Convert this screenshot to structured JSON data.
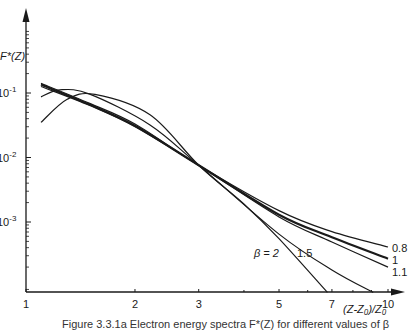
{
  "chart_data": {
    "type": "line",
    "title": "",
    "xlabel": "(Z-Z₀)/Z₀",
    "ylabel": "F*(Z)",
    "xscale": "log",
    "yscale": "log",
    "xlim": [
      1,
      11
    ],
    "ylim_log10": [
      -4.09,
      0.25
    ],
    "grid": false,
    "x_ticks": [
      {
        "value": 1,
        "label": "1"
      },
      {
        "value": 2,
        "label": "2"
      },
      {
        "value": 3,
        "label": "3"
      },
      {
        "value": 5,
        "label": "5"
      },
      {
        "value": 7,
        "label": "7"
      },
      {
        "value": 10,
        "label": "10"
      }
    ],
    "y_ticks": [
      {
        "value": 0.1,
        "label": "10",
        "exp": "-1"
      },
      {
        "value": 0.01,
        "label": "10",
        "exp": "-2"
      },
      {
        "value": 0.001,
        "label": "10",
        "exp": "-3"
      }
    ],
    "series": [
      {
        "name": "0.8",
        "label": "0.8",
        "weight": "normal",
        "points": [
          [
            1.1,
            0.141
          ],
          [
            1.5,
            0.069
          ],
          [
            2,
            0.033
          ],
          [
            3,
            0.0076
          ],
          [
            5,
            0.0015
          ],
          [
            7,
            0.00071
          ],
          [
            10,
            0.00041
          ]
        ]
      },
      {
        "name": "1",
        "label": "1",
        "weight": "bold",
        "points": [
          [
            1.1,
            0.135
          ],
          [
            1.5,
            0.066
          ],
          [
            2,
            0.031
          ],
          [
            3,
            0.0076
          ],
          [
            5,
            0.0013
          ],
          [
            7,
            0.00058
          ],
          [
            10,
            0.00027
          ]
        ]
      },
      {
        "name": "1.1",
        "label": "1.1",
        "weight": "normal",
        "points": [
          [
            1.1,
            0.126
          ],
          [
            1.5,
            0.064
          ],
          [
            2,
            0.03
          ],
          [
            3,
            0.0076
          ],
          [
            5,
            0.0012
          ],
          [
            7,
            0.00049
          ],
          [
            10,
            0.0002
          ]
        ]
      },
      {
        "name": "1.5",
        "label": "1.5",
        "weight": "normal",
        "points": [
          [
            1.1,
            0.087
          ],
          [
            1.24,
            0.112
          ],
          [
            1.5,
            0.096
          ],
          [
            2.2,
            0.032
          ],
          [
            3,
            0.0076
          ],
          [
            5,
            0.00065
          ],
          [
            7,
            0.00018
          ],
          [
            9.1,
            8.1e-05
          ]
        ]
      },
      {
        "name": "2",
        "label": "β = 2",
        "weight": "normal",
        "points": [
          [
            1.1,
            0.035
          ],
          [
            1.3,
            0.08
          ],
          [
            1.55,
            0.095
          ],
          [
            2.2,
            0.046
          ],
          [
            3,
            0.0076
          ],
          [
            4,
            0.0019
          ],
          [
            5,
            0.00055
          ],
          [
            6.8,
            8.1e-05
          ]
        ]
      }
    ],
    "annotations": [
      "β = 2",
      "1.5",
      "0.8",
      "1",
      "1.1"
    ]
  },
  "caption": "Figure 3.3.1a   Electron energy spectra F*(Z) for different values of β"
}
